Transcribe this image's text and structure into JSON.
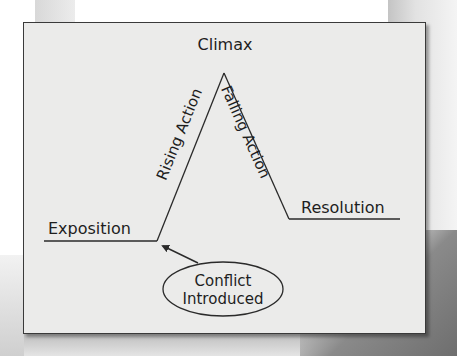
{
  "diagram": {
    "labels": {
      "climax": "Climax",
      "rising_action": "Rising Action",
      "falling_action": "Falling Action",
      "exposition": "Exposition",
      "resolution": "Resolution",
      "conflict_line1": "Conflict",
      "conflict_line2": "Introduced"
    },
    "colors": {
      "panel_bg": "#ebebea",
      "line": "#2a2a2a",
      "text": "#1e1e1e"
    }
  }
}
